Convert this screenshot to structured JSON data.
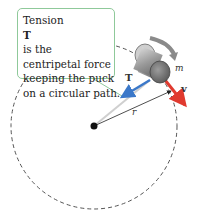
{
  "callout": {
    "lines": [
      "Tension T is the",
      "centripetal force",
      "keeping the puck",
      "on a circular path."
    ],
    "line1_prefix": "Tension ",
    "line1_vector": "T",
    "line1_suffix": " is the"
  },
  "labels": {
    "mass": "m",
    "radius": "r",
    "tension_vector": "T",
    "velocity_vector": "v"
  },
  "colors": {
    "callout_border": "#8fc99a",
    "tension_arrow": "#3b78c9",
    "velocity_arrow": "#e03a2f",
    "circle": "#555555",
    "rotation_arrow": "#8a8a8a"
  }
}
